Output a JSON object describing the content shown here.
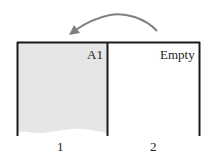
{
  "diagram": {
    "type": "slot-move",
    "arrow": {
      "from": "slot-2",
      "to": "slot-1",
      "color": "#808080"
    },
    "slots": [
      {
        "index_label": "1",
        "content_label": "A1",
        "fill": "#e6e6e6",
        "state": "occupied"
      },
      {
        "index_label": "2",
        "content_label": "Empty",
        "fill": "#ffffff",
        "state": "empty"
      }
    ],
    "border_color": "#1a1a1a"
  }
}
